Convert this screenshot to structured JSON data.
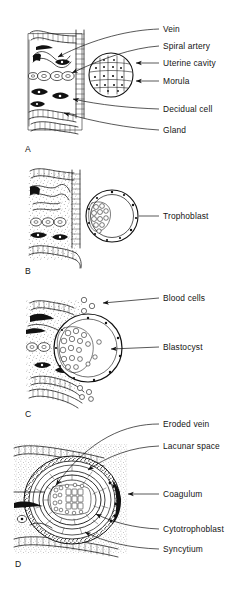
{
  "figure": {
    "background_color": "#ffffff",
    "ink_color": "#111111",
    "panels": [
      {
        "id": "A",
        "letter": "A",
        "caption": "Morula in the uterine cavity adjacent to the decidualized endometrium",
        "labels": [
          {
            "id": "vein",
            "text": "Vein",
            "pointer": "curved-leader"
          },
          {
            "id": "spiral-artery",
            "text": "Spiral artery",
            "pointer": "curved-leader"
          },
          {
            "id": "uterine-cavity",
            "text": "Uterine cavity",
            "pointer": "arrow-left"
          },
          {
            "id": "morula",
            "text": "Morula",
            "pointer": "arrow-left"
          },
          {
            "id": "decidual-cell",
            "text": "Decidual cell",
            "pointer": "curved-leader"
          },
          {
            "id": "gland",
            "text": "Gland",
            "pointer": "curved-leader"
          }
        ]
      },
      {
        "id": "B",
        "letter": "B",
        "caption": "Free blastocyst with trophoblast apposed to the endometrial surface",
        "labels": [
          {
            "id": "trophoblast",
            "text": "Trophoblast",
            "pointer": "straight-leader"
          }
        ]
      },
      {
        "id": "C",
        "letter": "C",
        "caption": "Blastocyst attaching and beginning to erode the endometrium",
        "labels": [
          {
            "id": "blood-cells",
            "text": "Blood cells",
            "pointer": "arrow-left"
          },
          {
            "id": "blastocyst",
            "text": "Blastocyst",
            "pointer": "arrow-left"
          }
        ]
      },
      {
        "id": "D",
        "letter": "D",
        "caption": "Interstitially implanted conceptus with lacunar trophoblast",
        "labels": [
          {
            "id": "eroded-vein",
            "text": "Eroded vein",
            "pointer": "curved-leader"
          },
          {
            "id": "lacunar-space",
            "text": "Lacunar space",
            "pointer": "curved-leader"
          },
          {
            "id": "coagulum",
            "text": "Coagulum",
            "pointer": "arrow-left"
          },
          {
            "id": "cytotrophoblast",
            "text": "Cytotrophoblast",
            "pointer": "curved-leader"
          },
          {
            "id": "syncytium",
            "text": "Syncytium",
            "pointer": "curved-leader"
          }
        ]
      }
    ]
  }
}
